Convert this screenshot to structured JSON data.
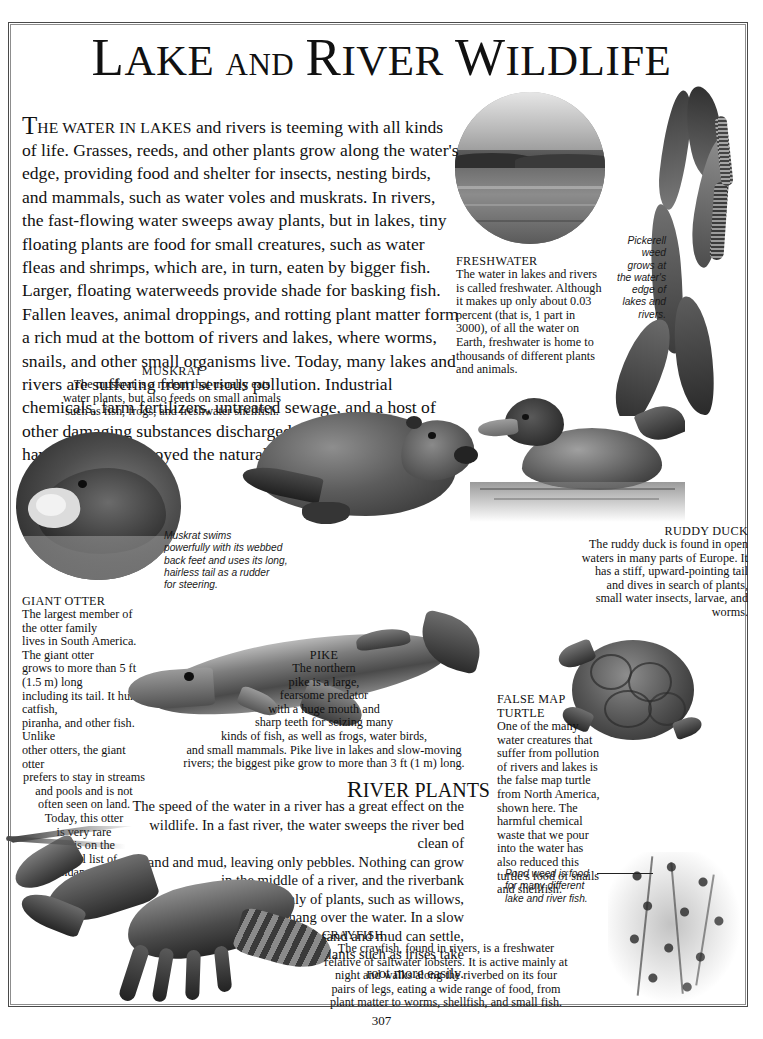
{
  "page": {
    "title_line": "LAKE AND RIVER WILDLIFE",
    "title_word1": "L",
    "title_word1_rest": "AKE",
    "title_and": "AND",
    "title_word2": "R",
    "title_word2_rest": "IVER",
    "title_word3": "W",
    "title_word3_rest": "ILDLIFE",
    "folio": "307"
  },
  "intro": {
    "dropcap": "T",
    "smallcaps": "HE WATER IN LAKES",
    "text": " and rivers is teeming with all kinds of life. Grasses, reeds, and other plants grow along the water's edge, providing food and shelter for insects, nesting birds, and mammals, such as water voles and muskrats. In rivers, the fast-flowing water sweeps away plants, but in lakes, tiny floating plants are food for small creatures, such as water fleas and shrimps, which are, in turn, eaten by bigger fish. Larger, floating waterweeds provide shade for basking fish. Fallen leaves, animal droppings, and rotting plant matter form a rich mud at the bottom of rivers and lakes, where worms, snails, and other small organisms live. Today, many lakes and rivers are suffering from serious pollution. Industrial chemicals, farm fertilizers, untreated sewage, and a host of other damaging substances discharged into lakes and rivers have upset or destroyed the natural wildlife balance."
  },
  "captions": {
    "freshwater": {
      "heading": "FRESHWATER",
      "body": "The water in lakes and rivers is called freshwater. Although it makes up only about 0.03 percent (that is, 1 part in 3000), of all the water on Earth, freshwater is home to thousands of different plants and animals."
    },
    "muskrat": {
      "heading": "MUSKRAT",
      "body": "The muskrat is a rodent that usually eats water plants, but also feeds on small animals such as fish, frogs, and freshwater shellfish."
    },
    "giant_otter": {
      "heading": "GIANT OTTER",
      "lines": [
        "The largest member of the otter family",
        "lives in South America. The giant otter",
        "grows to more than 5 ft (1.5 m) long",
        "including its tail. It hunts catfish,",
        "piranha, and other fish. Unlike",
        "other otters, the giant otter",
        "prefers to stay in streams",
        "and pools and is not",
        "often seen on land.",
        "Today, this otter",
        "is very rare",
        "and is on the",
        "official list of",
        "endangered",
        "species."
      ]
    },
    "ruddy_duck": {
      "heading": "RUDDY DUCK",
      "body": "The ruddy duck is found in open waters in many parts of Europe. It has a stiff, upward-pointing tail and dives in search of plants, small water insects, larvae, and worms."
    },
    "pike": {
      "heading": "PIKE",
      "lines": [
        "The northern",
        "pike is a large,",
        "fearsome predator",
        "with a huge mouth and",
        "sharp teeth for seizing many",
        "kinds of fish, as well as frogs, water birds,",
        "and small mammals. Pike live in lakes and slow-moving",
        "rivers; the biggest pike grow to more than 3 ft (1 m) long."
      ]
    },
    "false_map_turtle": {
      "heading": "FALSE MAP\nTURTLE",
      "body": "One of the many water creatures that suffer from pollution of rivers and lakes is the false map turtle from North America, shown here. The harmful chemical waste that we pour into the water has also reduced this turtle's food of snails and shellfish."
    },
    "crayfish": {
      "heading": "CRAYFISH",
      "body": "The crayfish, found in rivers, is a freshwater relative of saltwater lobsters. It is active mainly at night and walks along the riverbed on its four pairs of legs, eating a wide range of food, from plant matter to worms, shellfish, and small fish."
    }
  },
  "annotations": {
    "pickerell_weed": "Pickerell\nweed\ngrows at\nthe water's\nedge of\nlakes and\nrivers.",
    "muskrat_swims": "Muskrat swims\npowerfully with its webbed\nback feet and uses its long,\nhairless tail as a rudder\nfor steering.",
    "pond_weed": "Pond weed is food\nfor many different\nlake and river fish."
  },
  "section": {
    "river_plants_heading_cap": "R",
    "river_plants_heading_rest": "IVER PLANTS",
    "river_plants_lines": [
      "The speed of the water in a river has a great effect on the",
      "wildlife. In a fast river, the water sweeps the river bed clean of",
      "sand and mud, leaving only pebbles. Nothing can grow",
      "in the middle of a river, and the riverbank",
      "consists mainly of plants, such as willows,",
      "that hang over the water. In a slow",
      "river, sand and mud can settle,",
      "and plants such as irises take",
      "root more easily."
    ]
  },
  "colors": {
    "page_bg": "#ffffff",
    "ink": "#111111",
    "frame": "#4a4a4a"
  },
  "figures": [
    "freshwater-lake-photo",
    "pickerell-weed-illustration",
    "muskrat-illustration",
    "giant-otter-illustration",
    "ruddy-duck-illustration",
    "pike-illustration",
    "false-map-turtle-illustration",
    "crayfish-illustration",
    "pond-weed-illustration"
  ]
}
